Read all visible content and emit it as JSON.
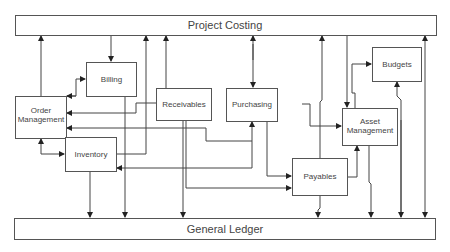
{
  "diagram": {
    "title_top": "Project Costing",
    "title_bottom": "General Ledger",
    "nodes": {
      "billing": "Billing",
      "order_management_line1": "Order",
      "order_management_line2": "Management",
      "receivables": "Receivables",
      "purchasing": "Purchasing",
      "asset_management_line1": "Asset",
      "asset_management_line2": "Management",
      "budgets": "Budgets",
      "inventory": "Inventory",
      "payables": "Payables"
    },
    "colors": {
      "stroke": "#444444",
      "text": "#444444",
      "background": "#ffffff"
    }
  }
}
